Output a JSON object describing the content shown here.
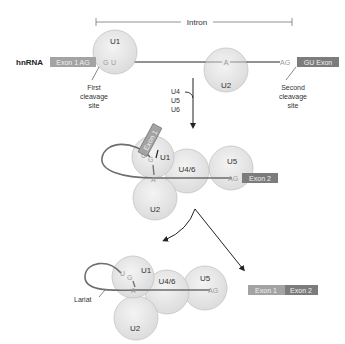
{
  "diagram": {
    "colors": {
      "sphere_fill": "#e6e6e6",
      "sphere_stroke": "#c4c4c4",
      "rna_line": "#6e6e6e",
      "exon1_box": "#a3a3a3",
      "exon2_box": "#7c7c7c",
      "arrow": "#222222",
      "nucleotide_text": "#9a9a9a"
    },
    "stage1": {
      "intron_label": "Intron",
      "hnrna_label": "hnRNA",
      "exon1_label": "Exon 1 AG",
      "exon2_label": "GU Exon",
      "nuc_g_5": "G",
      "nuc_u_5": "U",
      "branch_a": "A",
      "nuc_ag_3": "AG",
      "u1": "U1",
      "u2": "U2",
      "first_site": [
        "First",
        "cleavage",
        "site"
      ],
      "second_site": [
        "Second",
        "cleavage",
        "site"
      ],
      "incoming": [
        "U4",
        "U5",
        "U6"
      ]
    },
    "stage2": {
      "exon1_label": "Exon 1",
      "exon2_label": "Exon 2",
      "u1": "U1",
      "u2": "U2",
      "u46": "U4/6",
      "u5": "U5",
      "nuc_u": "U",
      "nuc_g": "G",
      "branch_a": "A",
      "nuc_ag": "AG"
    },
    "stage3": {
      "u1": "U1",
      "u2": "U2",
      "u46": "U4/6",
      "u5": "U5",
      "nuc_u": "U",
      "nuc_g": "G",
      "branch_a": "A",
      "nuc_ag": "AG",
      "lariat_label": "Lariat",
      "product_exon1": "Exon 1",
      "product_exon2": "Exon 2"
    }
  }
}
